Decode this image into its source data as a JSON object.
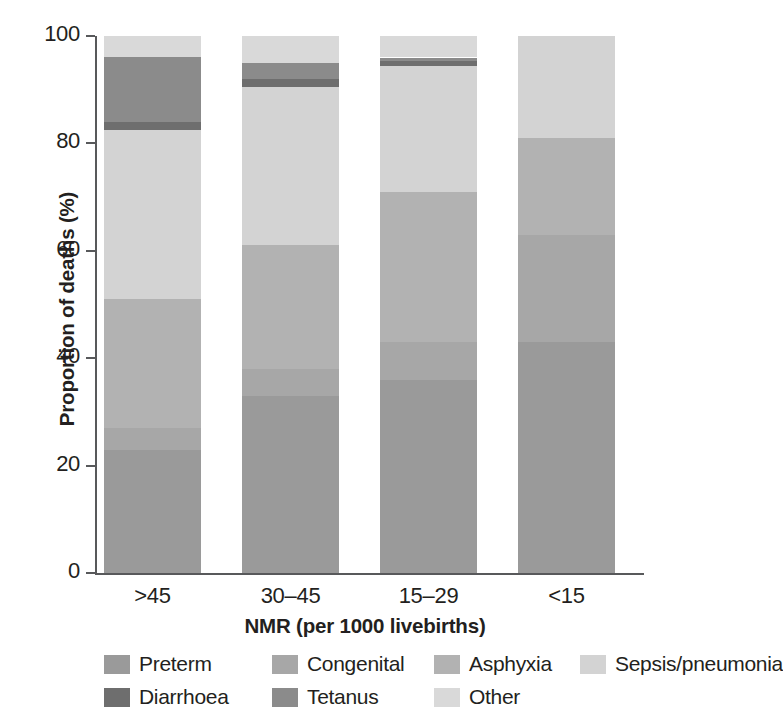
{
  "chart_data": {
    "type": "bar",
    "subtype": "stacked-bar-100pct",
    "title": "",
    "xlabel": "NMR (per 1000 livebirths)",
    "ylabel": "Proportion of deaths (%)",
    "ylim": [
      0,
      100
    ],
    "yticks": [
      0,
      20,
      40,
      60,
      80,
      100
    ],
    "ytick_labels": [
      "0",
      "20",
      "40",
      "60",
      "80",
      "100"
    ],
    "grid": false,
    "legend_position": "bottom",
    "categories": [
      ">45",
      "30–45",
      "15–29",
      "<15"
    ],
    "series": [
      {
        "name": "Preterm",
        "color": "#9a9a9a",
        "values": [
          23,
          33,
          36,
          43
        ]
      },
      {
        "name": "Congenital",
        "color": "#a7a7a7",
        "values": [
          4,
          5,
          7,
          20
        ]
      },
      {
        "name": "Asphyxia",
        "color": "#b2b2b2",
        "values": [
          24,
          23,
          28,
          18
        ]
      },
      {
        "name": "Sepsis/pneumonia",
        "color": "#d3d3d3",
        "values": [
          31.5,
          29.5,
          23.5,
          19
        ]
      },
      {
        "name": "Diarrhoea",
        "color": "#6e6e6e",
        "values": [
          1.5,
          1.5,
          0.8,
          0
        ]
      },
      {
        "name": "Tetanus",
        "color": "#8b8b8b",
        "values": [
          12,
          3,
          0.7,
          0
        ]
      },
      {
        "name": "Other",
        "color": "#d9d9d9",
        "values": [
          4,
          5,
          4,
          0
        ]
      }
    ],
    "stack_order_bottom_to_top": [
      "Preterm",
      "Congenital",
      "Asphyxia",
      "Sepsis/pneumonia",
      "Diarrhoea",
      "Tetanus",
      "Other"
    ]
  },
  "axes": {
    "y_title": "Proportion of deaths (%)",
    "x_title": "NMR (per 1000 livebirths)",
    "y_ticks": [
      {
        "value": 100,
        "label": "100"
      },
      {
        "value": 80,
        "label": "80"
      },
      {
        "value": 60,
        "label": "60"
      },
      {
        "value": 40,
        "label": "40"
      },
      {
        "value": 20,
        "label": "20"
      },
      {
        "value": 0,
        "label": "0"
      }
    ],
    "x_ticks": [
      {
        "label": ">45"
      },
      {
        "label": "30–45"
      },
      {
        "label": "15–29"
      },
      {
        "label": "<15"
      }
    ],
    "axis_color": "#58595b"
  },
  "legend": {
    "rows": [
      [
        {
          "label": "Preterm",
          "color": "#9a9a9a"
        },
        {
          "label": "Congenital",
          "color": "#a7a7a7"
        },
        {
          "label": "Asphyxia",
          "color": "#b2b2b2"
        },
        {
          "label": "Sepsis/pneumonia",
          "color": "#d3d3d3"
        }
      ],
      [
        {
          "label": "Diarrhoea",
          "color": "#6e6e6e"
        },
        {
          "label": "Tetanus",
          "color": "#8b8b8b"
        },
        {
          "label": "Other",
          "color": "#d9d9d9"
        }
      ]
    ]
  },
  "colors": {
    "background": "#ffffff",
    "text": "#231f20",
    "axis": "#58595b"
  }
}
